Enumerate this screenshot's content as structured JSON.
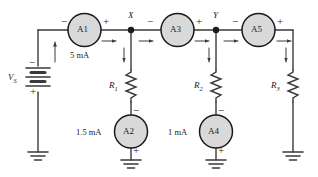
{
  "figure": {
    "type": "circuit-schematic",
    "background_color": "#ffffff",
    "wire_color": "#3a3a3a",
    "meter_fill": "#d9d9d9",
    "meter_stroke": "#1a1a1a",
    "text_color": "#1a1a1a"
  },
  "source": {
    "name": "voltage-source",
    "label": "V",
    "label_sub": "S",
    "terminal_top": "−",
    "terminal_bottom": "+",
    "symbol": "battery-multicell"
  },
  "meters": [
    {
      "id": "A1",
      "label": "A1",
      "orientation": "horizontal",
      "terminal_left": "−",
      "terminal_right": "+",
      "reading": "5 mA",
      "reading_position": "below"
    },
    {
      "id": "A2",
      "label": "A2",
      "orientation": "vertical",
      "terminal_top": "−",
      "terminal_bottom": "+",
      "reading": "1.5 mA",
      "reading_position": "left"
    },
    {
      "id": "A3",
      "label": "A3",
      "orientation": "horizontal",
      "terminal_left": "−",
      "terminal_right": "+",
      "reading": "",
      "reading_position": "below"
    },
    {
      "id": "A4",
      "label": "A4",
      "orientation": "vertical",
      "terminal_top": "−",
      "terminal_bottom": "+",
      "reading": "1 mA",
      "reading_position": "left"
    },
    {
      "id": "A5",
      "label": "A5",
      "orientation": "horizontal",
      "terminal_left": "−",
      "terminal_right": "+",
      "reading": "",
      "reading_position": "below"
    }
  ],
  "resistors": [
    {
      "id": "R1",
      "label": "R",
      "label_sub": "1",
      "branch": "node-X"
    },
    {
      "id": "R2",
      "label": "R",
      "label_sub": "2",
      "branch": "node-Y"
    },
    {
      "id": "R3",
      "label": "R",
      "label_sub": "3",
      "branch": "right-rail"
    }
  ],
  "nodes": [
    {
      "id": "X",
      "label": "X"
    },
    {
      "id": "Y",
      "label": "Y"
    }
  ],
  "grounds": [
    {
      "id": "gnd-source",
      "symbol": "earth-ground"
    },
    {
      "id": "gnd-a2",
      "symbol": "earth-ground"
    },
    {
      "id": "gnd-a4",
      "symbol": "earth-ground"
    },
    {
      "id": "gnd-r3",
      "symbol": "earth-ground"
    }
  ],
  "current_arrows": [
    {
      "id": "i-source",
      "direction": "up",
      "branch": "left-rail"
    },
    {
      "id": "i-a1-out",
      "direction": "right",
      "branch": "top-rail-a1"
    },
    {
      "id": "i-x-right",
      "direction": "right",
      "branch": "top-rail-x"
    },
    {
      "id": "i-r1",
      "direction": "down",
      "branch": "r1-branch"
    },
    {
      "id": "i-a3-out",
      "direction": "right",
      "branch": "top-rail-a3"
    },
    {
      "id": "i-y-right",
      "direction": "right",
      "branch": "top-rail-y"
    },
    {
      "id": "i-r2",
      "direction": "down",
      "branch": "r2-branch"
    },
    {
      "id": "i-a5-out",
      "direction": "right",
      "branch": "top-rail-a5"
    },
    {
      "id": "i-r3",
      "direction": "down",
      "branch": "r3-branch"
    }
  ]
}
